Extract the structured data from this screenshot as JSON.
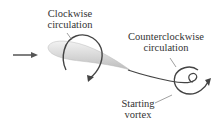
{
  "diagram": {
    "labels": {
      "clockwise_line1": "Clockwise",
      "clockwise_line2": "circulation",
      "ccw_line1": "Counterclockwise",
      "ccw_line2": "circulation",
      "starting_line1": "Starting",
      "starting_line2": "vortex"
    },
    "elements": [
      "flow-arrow",
      "airfoil",
      "clockwise-circulation-arrow",
      "wake-line",
      "starting-vortex-spiral",
      "counterclockwise-circulation-arrow"
    ],
    "colors": {
      "line": "#444444",
      "airfoil_fill": "#dcdcdc",
      "text": "#333333"
    }
  }
}
